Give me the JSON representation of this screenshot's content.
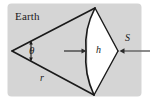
{
  "figure": {
    "kind": "geometry-diagram",
    "width": 150,
    "height": 103,
    "background_color": "#ffffff",
    "panel_color": "#d5d5d5",
    "stroke_color": "#1a1a1a",
    "arrow_color": "#4a4a4a",
    "labels": {
      "earth": "Earth",
      "theta": "θ",
      "radius": "r",
      "height": "h",
      "area": "S"
    },
    "geometry": {
      "apex_left": [
        12,
        51
      ],
      "apex_right": [
        118,
        51
      ],
      "rim_top": [
        95,
        8
      ],
      "rim_bottom": [
        94,
        95
      ],
      "arc_mid": [
        86,
        51
      ],
      "angle_tick_top": [
        31,
        42
      ],
      "angle_tick_bottom": [
        31,
        60
      ]
    },
    "arrows": {
      "height_arrow": {
        "from": [
          64,
          51
        ],
        "to": [
          86,
          51
        ],
        "direction": "right"
      },
      "flux_arrow": {
        "from": [
          150,
          51
        ],
        "to": [
          120,
          51
        ],
        "direction": "left"
      }
    }
  }
}
